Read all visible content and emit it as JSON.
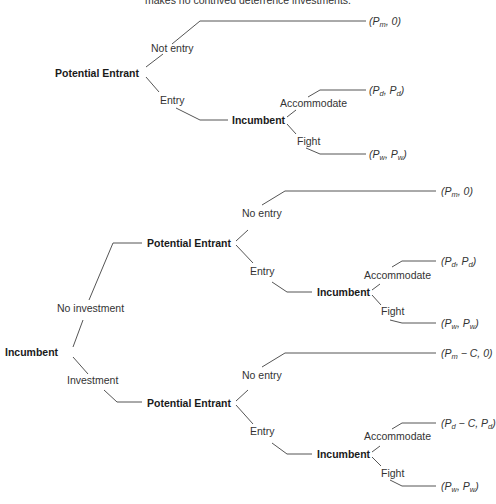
{
  "caption": "makes no contrived deterrence investments.",
  "top_tree": {
    "root": "Potential Entrant",
    "branch_not_entry": "Not entry",
    "branch_entry": "Entry",
    "payoff_not_entry": {
      "a": "P",
      "a_sub": "m",
      "b": "0"
    },
    "incumbent": "Incumbent",
    "branch_accommodate": "Accommodate",
    "branch_fight": "Fight",
    "payoff_accommodate": {
      "a": "P",
      "a_sub": "d",
      "b": "P",
      "b_sub": "d"
    },
    "payoff_fight": {
      "a": "P",
      "a_sub": "w",
      "b": "P",
      "b_sub": "w"
    }
  },
  "bottom_tree": {
    "root": "Incumbent",
    "branch_no_investment": "No investment",
    "branch_investment": "Investment",
    "no_investment": {
      "entrant": "Potential Entrant",
      "branch_no_entry": "No entry",
      "branch_entry": "Entry",
      "payoff_no_entry": {
        "a": "P",
        "a_sub": "m",
        "b": "0"
      },
      "incumbent": "Incumbent",
      "branch_accommodate": "Accommodate",
      "branch_fight": "Fight",
      "payoff_accommodate": {
        "a": "P",
        "a_sub": "d",
        "b": "P",
        "b_sub": "d"
      },
      "payoff_fight": {
        "a": "P",
        "a_sub": "w",
        "b": "P",
        "b_sub": "w"
      }
    },
    "investment": {
      "entrant": "Potential Entrant",
      "branch_no_entry": "No entry",
      "branch_entry": "Entry",
      "payoff_no_entry": {
        "a": "P",
        "a_sub": "m",
        "a_tail": " − C",
        "b": "0"
      },
      "incumbent": "Incumbent",
      "branch_accommodate": "Accommodate",
      "branch_fight": "Fight",
      "payoff_accommodate": {
        "a": "P",
        "a_sub": "d",
        "a_tail": " − C",
        "b": "P",
        "b_sub": "d"
      },
      "payoff_fight": {
        "a": "P",
        "a_sub": "w",
        "b": "P",
        "b_sub": "w"
      }
    }
  }
}
